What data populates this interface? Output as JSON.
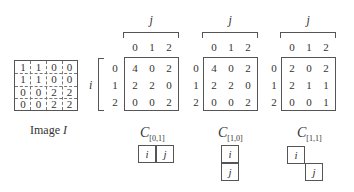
{
  "image": {
    "label_prefix": "Image ",
    "label_var": "I",
    "matrix": [
      [
        1,
        1,
        0,
        0
      ],
      [
        1,
        1,
        0,
        0
      ],
      [
        0,
        0,
        2,
        2
      ],
      [
        0,
        0,
        2,
        2
      ]
    ]
  },
  "axis": {
    "row_var": "i",
    "col_var": "j",
    "indices": [
      "0",
      "1",
      "2"
    ]
  },
  "cooccurrence": [
    {
      "name": "C",
      "subscript": "[0,1]",
      "matrix": [
        [
          4,
          0,
          2
        ],
        [
          2,
          2,
          0
        ],
        [
          0,
          0,
          2
        ]
      ],
      "offset_cells": [
        "i",
        "j"
      ]
    },
    {
      "name": "C",
      "subscript": "[1,0]",
      "matrix": [
        [
          4,
          0,
          2
        ],
        [
          2,
          2,
          0
        ],
        [
          0,
          0,
          2
        ]
      ],
      "offset_cells": [
        "i",
        "j"
      ]
    },
    {
      "name": "C",
      "subscript": "[1,1]",
      "matrix": [
        [
          2,
          0,
          2
        ],
        [
          2,
          1,
          1
        ],
        [
          0,
          0,
          1
        ]
      ],
      "offset_cells": [
        "i",
        "j"
      ]
    }
  ]
}
